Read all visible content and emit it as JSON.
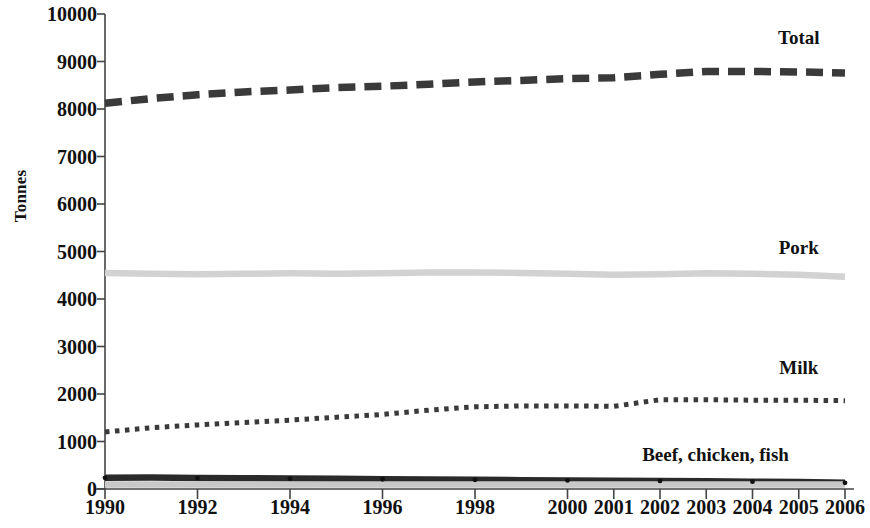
{
  "chart_data": {
    "type": "line",
    "title": "",
    "subtitle": "",
    "xlabel": "",
    "ylabel": "Tonnes",
    "x": [
      1990,
      1991,
      1992,
      1993,
      1994,
      1995,
      1996,
      1997,
      1998,
      1999,
      2000,
      2001,
      2002,
      2003,
      2004,
      2005,
      2006
    ],
    "categories": [
      "1990",
      "1991",
      "1992",
      "1993",
      "1994",
      "1995",
      "1996",
      "1997",
      "1998",
      "1999",
      "2000",
      "2001",
      "2002",
      "2003",
      "2004",
      "2005",
      "2006"
    ],
    "x_tick_labels": [
      "1990",
      "1992",
      "1994",
      "1996",
      "1998",
      "2000",
      "2001",
      "2002",
      "2003",
      "2004",
      "2005",
      "2006"
    ],
    "y_tick_labels": [
      "10000",
      "9000",
      "8000",
      "7000",
      "6000",
      "5000",
      "4000",
      "3000",
      "2000",
      "1000",
      "0"
    ],
    "y_ticks": [
      10000,
      9000,
      8000,
      7000,
      6000,
      5000,
      4000,
      3000,
      2000,
      1000,
      0
    ],
    "ylim": [
      0,
      10000
    ],
    "grid": false,
    "legend_position": "inline-right",
    "series": [
      {
        "name": "Total",
        "label": "Total",
        "style": "dashed-thick",
        "color": "#3a3a3a",
        "values": [
          8120,
          8220,
          8300,
          8360,
          8400,
          8450,
          8480,
          8520,
          8570,
          8600,
          8640,
          8660,
          8730,
          8790,
          8790,
          8780,
          8760
        ]
      },
      {
        "name": "Pork",
        "label": "Pork",
        "style": "solid-thick",
        "color": "#d2d2d2",
        "values": [
          4550,
          4530,
          4520,
          4530,
          4540,
          4530,
          4540,
          4560,
          4560,
          4550,
          4530,
          4510,
          4520,
          4540,
          4530,
          4510,
          4470
        ]
      },
      {
        "name": "Milk",
        "label": "Milk",
        "style": "dotted",
        "color": "#3a3a3a",
        "values": [
          1200,
          1290,
          1350,
          1400,
          1450,
          1510,
          1570,
          1660,
          1730,
          1750,
          1750,
          1740,
          1880,
          1880,
          1870,
          1870,
          1860
        ]
      },
      {
        "name": "Beef, chicken, fish",
        "label": "Beef, chicken, fish",
        "style": "solid-thick",
        "color": "#2a2a2a",
        "values": [
          235,
          240,
          230,
          225,
          220,
          215,
          205,
          200,
          195,
          185,
          180,
          175,
          170,
          165,
          155,
          145,
          130
        ]
      },
      {
        "name": "Other",
        "label": "",
        "style": "solid-thick",
        "color": "#c8c8c8",
        "values": [
          95,
          95,
          95,
          95,
          95,
          95,
          95,
          95,
          95,
          95,
          95,
          95,
          95,
          95,
          95,
          95,
          95
        ]
      }
    ],
    "annotations": [
      {
        "text": "Total",
        "x": 2005,
        "y": 9480
      },
      {
        "text": "Pork",
        "x": 2005,
        "y": 5060
      },
      {
        "text": "Milk",
        "x": 2005,
        "y": 2520
      },
      {
        "text": "Beef, chicken, fish",
        "x": 2003.2,
        "y": 700
      }
    ]
  },
  "colors": {
    "axis": "#444444",
    "text": "#111111",
    "total": "#3a3a3a",
    "pork": "#d2d2d2",
    "milk": "#3a3a3a",
    "beef": "#2a2a2a",
    "other": "#c8c8c8",
    "background": "#ffffff"
  }
}
